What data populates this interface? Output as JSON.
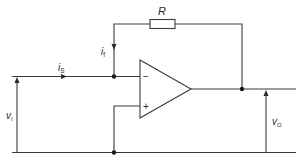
{
  "diagram": {
    "type": "circuit",
    "components": {
      "resistor": {
        "label": "R"
      },
      "opamp": {
        "inverting_input": "−",
        "non_inverting_input": "+"
      }
    },
    "labels": {
      "resistor": "R",
      "feedback_current": {
        "main": "i",
        "sub": "f"
      },
      "source_current": {
        "main": "i",
        "sub": "S"
      },
      "input_voltage": {
        "main": "v",
        "sub": "I"
      },
      "output_voltage": {
        "main": "v",
        "sub": "O"
      },
      "minus_sign": "−",
      "plus_sign": "+"
    },
    "colors": {
      "line": "#3a3a3a",
      "text": "#2a2a2a",
      "background": "#ffffff"
    }
  }
}
